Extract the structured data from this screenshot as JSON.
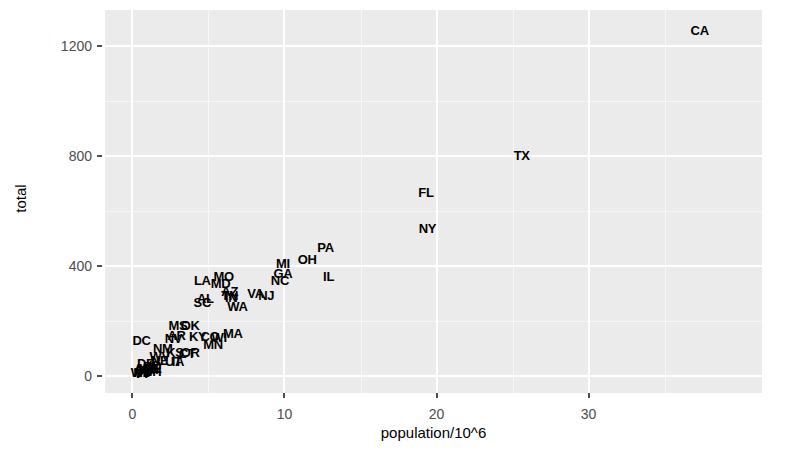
{
  "chart_data": {
    "type": "scatter",
    "title": "",
    "xlabel": "population/10^6",
    "ylabel": "total",
    "xlim": [
      -1.8,
      41.4
    ],
    "ylim": [
      -60,
      1330
    ],
    "xticks": [
      0,
      10,
      20,
      30
    ],
    "yticks": [
      0,
      400,
      800,
      1200
    ],
    "xtick_labels": [
      "0",
      "10",
      "20",
      "30"
    ],
    "ytick_labels": [
      "0",
      "400",
      "800",
      "1200"
    ],
    "grid": true,
    "legend": "none",
    "point_style": "text-label",
    "points": [
      {
        "label": "CA",
        "x": 37.3,
        "y": 1257
      },
      {
        "label": "TX",
        "x": 25.6,
        "y": 805
      },
      {
        "label": "FL",
        "x": 19.3,
        "y": 670
      },
      {
        "label": "NY",
        "x": 19.4,
        "y": 539
      },
      {
        "label": "PA",
        "x": 12.7,
        "y": 470
      },
      {
        "label": "IL",
        "x": 12.9,
        "y": 364
      },
      {
        "label": "OH",
        "x": 11.5,
        "y": 427
      },
      {
        "label": "GA",
        "x": 9.9,
        "y": 376
      },
      {
        "label": "MI",
        "x": 9.9,
        "y": 413
      },
      {
        "label": "NC",
        "x": 9.7,
        "y": 350
      },
      {
        "label": "MO",
        "x": 6.0,
        "y": 364
      },
      {
        "label": "LA",
        "x": 4.6,
        "y": 351
      },
      {
        "label": "MD",
        "x": 5.8,
        "y": 340
      },
      {
        "label": "VA",
        "x": 8.1,
        "y": 303
      },
      {
        "label": "TN",
        "x": 6.4,
        "y": 296
      },
      {
        "label": "AZ",
        "x": 6.4,
        "y": 309
      },
      {
        "label": "NJ",
        "x": 8.8,
        "y": 297
      },
      {
        "label": "IN",
        "x": 6.5,
        "y": 288
      },
      {
        "label": "AL",
        "x": 4.8,
        "y": 283
      },
      {
        "label": "SC",
        "x": 4.6,
        "y": 270
      },
      {
        "label": "WA",
        "x": 6.9,
        "y": 256
      },
      {
        "label": "MA",
        "x": 6.6,
        "y": 158
      },
      {
        "label": "WI",
        "x": 5.7,
        "y": 144
      },
      {
        "label": "CO",
        "x": 5.1,
        "y": 147
      },
      {
        "label": "MN",
        "x": 5.3,
        "y": 118
      },
      {
        "label": "OK",
        "x": 3.8,
        "y": 185
      },
      {
        "label": "KY",
        "x": 4.3,
        "y": 148
      },
      {
        "label": "MS",
        "x": 3.0,
        "y": 187
      },
      {
        "label": "AR",
        "x": 2.9,
        "y": 150
      },
      {
        "label": "NV",
        "x": 2.7,
        "y": 139
      },
      {
        "label": "DC",
        "x": 0.6,
        "y": 131
      },
      {
        "label": "OR",
        "x": 3.8,
        "y": 88
      },
      {
        "label": "CT",
        "x": 3.6,
        "y": 85
      },
      {
        "label": "KS",
        "x": 2.8,
        "y": 88
      },
      {
        "label": "NM",
        "x": 2.0,
        "y": 102
      },
      {
        "label": "IA",
        "x": 3.0,
        "y": 55
      },
      {
        "label": "UT",
        "x": 2.7,
        "y": 55
      },
      {
        "label": "WV",
        "x": 1.8,
        "y": 74
      },
      {
        "label": "NE",
        "x": 1.8,
        "y": 58
      },
      {
        "label": "ID",
        "x": 1.5,
        "y": 42
      },
      {
        "label": "ME",
        "x": 1.3,
        "y": 31
      },
      {
        "label": "NH",
        "x": 1.3,
        "y": 20
      },
      {
        "label": "HI",
        "x": 1.3,
        "y": 26
      },
      {
        "label": "RI",
        "x": 1.1,
        "y": 37
      },
      {
        "label": "MT",
        "x": 0.97,
        "y": 31
      },
      {
        "label": "DE",
        "x": 0.88,
        "y": 48
      },
      {
        "label": "SD",
        "x": 0.8,
        "y": 25
      },
      {
        "label": "AK",
        "x": 0.7,
        "y": 31
      },
      {
        "label": "ND",
        "x": 0.67,
        "y": 16
      },
      {
        "label": "VT",
        "x": 0.62,
        "y": 13
      },
      {
        "label": "WY",
        "x": 0.56,
        "y": 15
      }
    ]
  },
  "axes": {
    "x": {
      "title": "population/10^6",
      "ticks": [
        {
          "value": 0,
          "label": "0"
        },
        {
          "value": 10,
          "label": "10"
        },
        {
          "value": 20,
          "label": "20"
        },
        {
          "value": 30,
          "label": "30"
        }
      ]
    },
    "y": {
      "title": "total",
      "ticks": [
        {
          "value": 0,
          "label": "0"
        },
        {
          "value": 400,
          "label": "400"
        },
        {
          "value": 800,
          "label": "800"
        },
        {
          "value": 1200,
          "label": "1200"
        }
      ]
    }
  },
  "style": {
    "panel_background": "#ebebeb",
    "gridline_major": "#ffffff",
    "gridline_minor": "#f7f7f7",
    "point_color": "#000000",
    "axis_text_color": "#4d4d4d",
    "plot_background": "#ffffff"
  }
}
